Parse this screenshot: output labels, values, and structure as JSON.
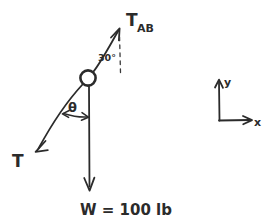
{
  "diagram": {
    "background_color": "#ffffff",
    "ink_color": "#2b2b2b",
    "labels": {
      "tension_ab_main": "T",
      "tension_ab_sub": "AB",
      "angle_ab": "30°",
      "theta": "θ",
      "tension_t": "T",
      "weight": "W = 100 lb"
    },
    "axes": {
      "y_label": "y",
      "x_label": "x"
    },
    "forces": [
      {
        "name": "T_AB",
        "label": "T AB",
        "direction": "up-right",
        "angle_from_vertical_deg": 30
      },
      {
        "name": "T",
        "label": "T",
        "direction": "down-left",
        "angle_from_vertical": "θ"
      },
      {
        "name": "W",
        "label": "W = 100 lb",
        "magnitude": 100,
        "unit": "lb",
        "direction": "down"
      }
    ]
  }
}
